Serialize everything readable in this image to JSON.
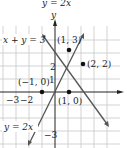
{
  "title_cropped": "y = 2x",
  "axes": {
    "x_label": "",
    "y_label": "y",
    "tick_labels": {
      "x_neg3": "−3",
      "x_neg2": "−2",
      "y_1": "1",
      "y_2": "2",
      "y_neg3": "−3"
    }
  },
  "lines": [
    {
      "equation": "x + y = 3",
      "label": "x + y = 3"
    },
    {
      "equation": "y = 2x",
      "label": "y = 2x"
    }
  ],
  "points": [
    {
      "label": "(1, 3)",
      "x": 1,
      "y": 3
    },
    {
      "label": "(2, 2)",
      "x": 2,
      "y": 2
    },
    {
      "label": "(−1, 0)",
      "x": -1,
      "y": 0
    },
    {
      "label": "(1, 0)",
      "x": 1,
      "y": 0
    }
  ],
  "colors": {
    "grid": "#c8c8c8",
    "axis": "#222222",
    "line": "#555555",
    "point": "#111111"
  }
}
